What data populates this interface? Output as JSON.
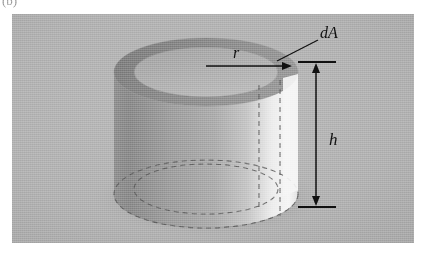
{
  "figure": {
    "panel_label": "(b)",
    "caption_type": "physics-diagram"
  },
  "labels": {
    "area_element": "dA",
    "radius": "r",
    "height": "h"
  },
  "colors": {
    "background": "#ffffff",
    "panel": "#b4b4b4",
    "cylinder_body_dark": "#8e8e8e",
    "cylinder_body_mid": "#a7a7a7",
    "cylinder_highlight": "#f2f2f2",
    "top_face_light": "#c9c9c9",
    "ring_dark": "#8a8a8a",
    "ring_rim": "#9c9c9c",
    "line": "#111111",
    "dashed": "#555555"
  },
  "geometry": {
    "panel": {
      "x": 12,
      "y": 14,
      "width": 402,
      "height": 229
    },
    "cylinder": {
      "center_x": 206,
      "top_y": 72,
      "bottom_y": 194,
      "rx": 92,
      "ry": 34
    },
    "ring": {
      "outer_rx": 92,
      "outer_ry": 34,
      "inner_rx": 72,
      "inner_ry": 25
    },
    "radius_arrow": {
      "x1": 206,
      "y1": 66,
      "x2": 291,
      "y2": 66
    },
    "height_line": {
      "x": 316,
      "y_top": 69,
      "y_bottom": 200
    },
    "leader_line": {
      "x1": 320,
      "y1": 38,
      "x2": 277,
      "y2": 60
    }
  },
  "annotations": {
    "dA_position": {
      "x": 322,
      "y": 34
    },
    "r_position": {
      "x": 236,
      "y": 58
    },
    "h_position": {
      "x": 330,
      "y": 140
    }
  }
}
